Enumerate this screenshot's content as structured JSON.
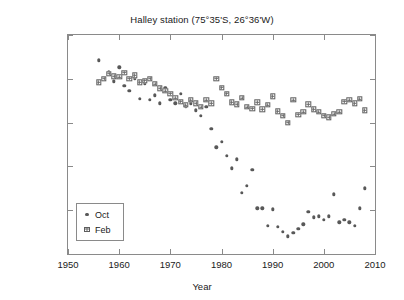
{
  "chart_data": {
    "type": "scatter",
    "title": "Halley station (75°35'S, 26°36'W)",
    "xlabel": "Year",
    "ylabel": "Ozone (DU)",
    "xlim": [
      1950,
      2010
    ],
    "ylim": [
      100,
      350
    ],
    "xticks": [
      1950,
      1960,
      1970,
      1980,
      1990,
      2000,
      2010
    ],
    "yticks": [
      100,
      150,
      200,
      250,
      300,
      350
    ],
    "grid": false,
    "legend_position": "lower left",
    "marker_color": "#585858",
    "axis_color": "#8a8a8a",
    "series": [
      {
        "name": "Oct",
        "marker": "filled-circle",
        "x": [
          1956,
          1957,
          1958,
          1959,
          1960,
          1961,
          1962,
          1963,
          1964,
          1965,
          1966,
          1967,
          1968,
          1969,
          1970,
          1971,
          1972,
          1973,
          1974,
          1975,
          1976,
          1977,
          1978,
          1979,
          1980,
          1981,
          1982,
          1983,
          1984,
          1985,
          1986,
          1987,
          1988,
          1989,
          1990,
          1991,
          1992,
          1993,
          1994,
          1995,
          1996,
          1997,
          1998,
          1999,
          2000,
          2001,
          2002,
          2003,
          2004,
          2005,
          2006,
          2007,
          2008
        ],
        "y": [
          321,
          300,
          308,
          297,
          313,
          292,
          286,
          300,
          277,
          294,
          276,
          281,
          272,
          290,
          276,
          272,
          283,
          268,
          272,
          264,
          258,
          268,
          243,
          222,
          228,
          212,
          198,
          208,
          170,
          178,
          196,
          152,
          152,
          132,
          151,
          131,
          125,
          120,
          124,
          129,
          134,
          148,
          142,
          143,
          139,
          143,
          168,
          136,
          139,
          136,
          132,
          152,
          175
        ]
      },
      {
        "name": "Feb",
        "marker": "square-crosshatch",
        "x": [
          1956,
          1957,
          1958,
          1959,
          1960,
          1961,
          1962,
          1963,
          1964,
          1965,
          1966,
          1967,
          1968,
          1969,
          1970,
          1971,
          1972,
          1973,
          1974,
          1975,
          1976,
          1977,
          1978,
          1979,
          1980,
          1981,
          1982,
          1983,
          1984,
          1985,
          1986,
          1987,
          1988,
          1989,
          1990,
          1991,
          1992,
          1993,
          1994,
          1995,
          1996,
          1997,
          1998,
          1999,
          2000,
          2001,
          2002,
          2003,
          2004,
          2005,
          2006,
          2007,
          2008
        ],
        "y": [
          296,
          300,
          306,
          303,
          302,
          307,
          300,
          304,
          296,
          298,
          300,
          294,
          289,
          286,
          283,
          278,
          274,
          270,
          276,
          272,
          268,
          276,
          272,
          300,
          290,
          283,
          273,
          271,
          278,
          268,
          266,
          273,
          265,
          270,
          280,
          263,
          258,
          250,
          276,
          259,
          262,
          271,
          265,
          262,
          258,
          256,
          260,
          262,
          274,
          276,
          272,
          277,
          264
        ]
      }
    ]
  },
  "legend": {
    "items": [
      {
        "label": "Oct",
        "marker": "filled-circle"
      },
      {
        "label": "Feb",
        "marker": "square-crosshatch"
      }
    ]
  }
}
